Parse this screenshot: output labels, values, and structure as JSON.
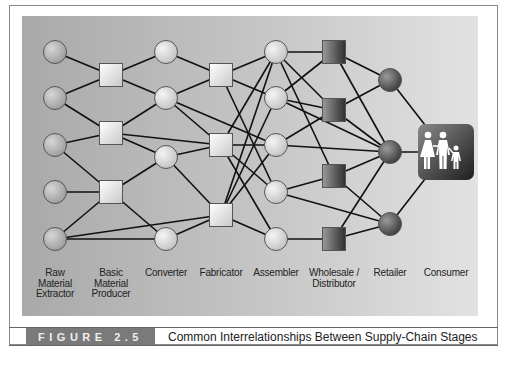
{
  "figure": {
    "number_label": "FIGURE 2.5",
    "title": "Common Interrelationships Between Supply-Chain Stages"
  },
  "colors": {
    "panel_left": "#a9a9a9",
    "panel_right": "#e2e2e2",
    "light_node": "#dcdcdc",
    "dark_node": "#555555",
    "consumer_box": "#3a3a3a",
    "edge": "#111111",
    "figure_label_bg": "#7a7a7a"
  },
  "stages": [
    {
      "id": "raw",
      "label_lines": [
        "Raw",
        "Material",
        "Extractor"
      ],
      "shape": "circle",
      "tone": "mid"
    },
    {
      "id": "basic",
      "label_lines": [
        "Basic",
        "Material",
        "Producer"
      ],
      "shape": "square",
      "tone": "light"
    },
    {
      "id": "converter",
      "label_lines": [
        "Converter"
      ],
      "shape": "circle",
      "tone": "light"
    },
    {
      "id": "fabricator",
      "label_lines": [
        "Fabricator"
      ],
      "shape": "square",
      "tone": "light"
    },
    {
      "id": "assembler",
      "label_lines": [
        "Assembler"
      ],
      "shape": "circle",
      "tone": "light"
    },
    {
      "id": "wholesale",
      "label_lines": [
        "Wholesale /",
        "Distributor"
      ],
      "shape": "square",
      "tone": "dark"
    },
    {
      "id": "retailer",
      "label_lines": [
        "Retailer"
      ],
      "shape": "circle",
      "tone": "dark"
    },
    {
      "id": "consumer",
      "label_lines": [
        "Consumer"
      ],
      "shape": "family-icon",
      "tone": "dark"
    }
  ],
  "nodes": {
    "raw": [
      [
        55,
        52
      ],
      [
        55,
        98
      ],
      [
        55,
        145
      ],
      [
        55,
        192
      ],
      [
        55,
        239
      ]
    ],
    "basic": [
      [
        111,
        75
      ],
      [
        111,
        133
      ],
      [
        111,
        192
      ]
    ],
    "converter": [
      [
        166,
        52
      ],
      [
        166,
        98
      ],
      [
        166,
        157
      ],
      [
        166,
        239
      ]
    ],
    "fabricator": [
      [
        221,
        75
      ],
      [
        221,
        145
      ],
      [
        221,
        215
      ]
    ],
    "assembler": [
      [
        276,
        52
      ],
      [
        276,
        98
      ],
      [
        276,
        145
      ],
      [
        276,
        192
      ],
      [
        276,
        239
      ]
    ],
    "wholesale": [
      [
        334,
        52
      ],
      [
        334,
        110
      ],
      [
        334,
        176
      ],
      [
        334,
        239
      ]
    ],
    "retailer": [
      [
        390,
        80
      ],
      [
        390,
        152
      ],
      [
        390,
        224
      ]
    ],
    "consumer": [
      [
        446,
        152
      ]
    ]
  },
  "edges": [
    [
      "raw.0",
      "basic.0"
    ],
    [
      "raw.1",
      "basic.0"
    ],
    [
      "raw.1",
      "basic.1"
    ],
    [
      "raw.2",
      "basic.1"
    ],
    [
      "raw.2",
      "basic.2"
    ],
    [
      "raw.3",
      "basic.2"
    ],
    [
      "raw.4",
      "basic.2"
    ],
    [
      "raw.4",
      "converter.3"
    ],
    [
      "raw.4",
      "fabricator.2"
    ],
    [
      "basic.0",
      "converter.0"
    ],
    [
      "basic.0",
      "converter.1"
    ],
    [
      "basic.1",
      "converter.1"
    ],
    [
      "basic.1",
      "converter.2"
    ],
    [
      "basic.1",
      "fabricator.1"
    ],
    [
      "basic.2",
      "converter.2"
    ],
    [
      "basic.2",
      "converter.3"
    ],
    [
      "converter.0",
      "fabricator.0"
    ],
    [
      "converter.1",
      "fabricator.0"
    ],
    [
      "converter.1",
      "fabricator.1"
    ],
    [
      "converter.1",
      "assembler.2"
    ],
    [
      "converter.2",
      "fabricator.1"
    ],
    [
      "converter.2",
      "fabricator.2"
    ],
    [
      "converter.3",
      "fabricator.2"
    ],
    [
      "fabricator.0",
      "assembler.0"
    ],
    [
      "fabricator.0",
      "assembler.1"
    ],
    [
      "fabricator.0",
      "assembler.3"
    ],
    [
      "fabricator.1",
      "assembler.0"
    ],
    [
      "fabricator.1",
      "assembler.2"
    ],
    [
      "fabricator.1",
      "assembler.3"
    ],
    [
      "fabricator.1",
      "assembler.4"
    ],
    [
      "fabricator.2",
      "assembler.0"
    ],
    [
      "fabricator.2",
      "assembler.1"
    ],
    [
      "fabricator.2",
      "assembler.2"
    ],
    [
      "fabricator.2",
      "assembler.4"
    ],
    [
      "assembler.0",
      "wholesale.0"
    ],
    [
      "assembler.0",
      "wholesale.1"
    ],
    [
      "assembler.0",
      "wholesale.2"
    ],
    [
      "assembler.1",
      "wholesale.0"
    ],
    [
      "assembler.1",
      "wholesale.1"
    ],
    [
      "assembler.2",
      "wholesale.1"
    ],
    [
      "assembler.2",
      "retailer.1"
    ],
    [
      "assembler.3",
      "wholesale.2"
    ],
    [
      "assembler.3",
      "retailer.2"
    ],
    [
      "assembler.4",
      "wholesale.3"
    ],
    [
      "assembler.1",
      "retailer.1"
    ],
    [
      "wholesale.0",
      "retailer.0"
    ],
    [
      "wholesale.0",
      "retailer.1"
    ],
    [
      "wholesale.1",
      "retailer.0"
    ],
    [
      "wholesale.1",
      "retailer.1"
    ],
    [
      "wholesale.2",
      "retailer.1"
    ],
    [
      "wholesale.2",
      "retailer.2"
    ],
    [
      "wholesale.3",
      "retailer.1"
    ],
    [
      "wholesale.3",
      "retailer.2"
    ],
    [
      "retailer.0",
      "consumer.0"
    ],
    [
      "retailer.1",
      "consumer.0"
    ],
    [
      "retailer.2",
      "consumer.0"
    ]
  ],
  "label_y": 268
}
